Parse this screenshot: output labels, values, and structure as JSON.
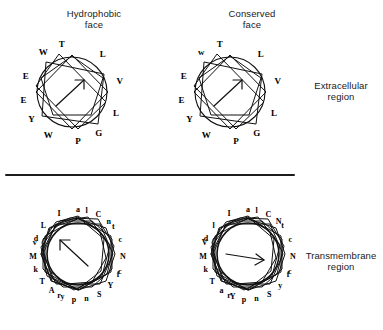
{
  "figure": {
    "divider": {
      "label": "section-divider"
    },
    "regions": {
      "extracellular": "Extracellular\nregion",
      "transmembrane": "Transmembrane\nregion"
    }
  },
  "panels": [
    {
      "id": "hydrophobic-face",
      "title": "Hydrophobic\nface",
      "region": "extracellular",
      "wheel_type": "heptagonal-star",
      "arrow_direction": "up-right",
      "residues": [
        {
          "label": "L",
          "angle_deg": 309
        },
        {
          "label": "V",
          "angle_deg": 347
        },
        {
          "label": "L",
          "angle_deg": 26
        },
        {
          "label": "T",
          "angle_deg": 258
        },
        {
          "label": "G",
          "angle_deg": 57
        },
        {
          "label": "W",
          "angle_deg": 234
        },
        {
          "label": "P",
          "angle_deg": 83
        },
        {
          "label": "E",
          "angle_deg": 199
        },
        {
          "label": "W",
          "angle_deg": 119
        },
        {
          "label": "E",
          "angle_deg": 171
        },
        {
          "label": "Y",
          "angle_deg": 146
        }
      ]
    },
    {
      "id": "conserved-face",
      "title": "Conserved\nface",
      "region": "extracellular",
      "wheel_type": "heptagonal-star",
      "arrow_direction": "up-right",
      "residues": [
        {
          "label": "L",
          "angle_deg": 309
        },
        {
          "label": "V",
          "angle_deg": 347
        },
        {
          "label": "L",
          "angle_deg": 26
        },
        {
          "label": "T",
          "angle_deg": 258
        },
        {
          "label": "G",
          "angle_deg": 57
        },
        {
          "label": "w",
          "angle_deg": 234
        },
        {
          "label": "P",
          "angle_deg": 83
        },
        {
          "label": "E",
          "angle_deg": 199
        },
        {
          "label": "W",
          "angle_deg": 119
        },
        {
          "label": "E",
          "angle_deg": 171
        },
        {
          "label": "Y",
          "angle_deg": 146
        }
      ]
    },
    {
      "id": "transmembrane-left",
      "title": "",
      "region": "transmembrane",
      "wheel_type": "dense-star",
      "arrow_direction": "up-left",
      "residues": [
        {
          "label": "a",
          "angle_deg": 270
        },
        {
          "label": "l",
          "angle_deg": 281
        },
        {
          "label": "C",
          "angle_deg": 297
        },
        {
          "label": "n",
          "angle_deg": 313
        },
        {
          "label": "t",
          "angle_deg": 322
        },
        {
          "label": "c",
          "angle_deg": 340
        },
        {
          "label": "N",
          "angle_deg": 3
        },
        {
          "label": "c",
          "angle_deg": 22
        },
        {
          "label": "f",
          "angle_deg": 27
        },
        {
          "label": "Y",
          "angle_deg": 44
        },
        {
          "label": "S",
          "angle_deg": 62
        },
        {
          "label": "n",
          "angle_deg": 79
        },
        {
          "label": "p",
          "angle_deg": 95
        },
        {
          "label": "y",
          "angle_deg": 110
        },
        {
          "label": "r",
          "angle_deg": 115
        },
        {
          "label": "A",
          "angle_deg": 126
        },
        {
          "label": "T",
          "angle_deg": 143
        },
        {
          "label": "k",
          "angle_deg": 160
        },
        {
          "label": "M",
          "angle_deg": 178
        },
        {
          "label": "v",
          "angle_deg": 196
        },
        {
          "label": "d",
          "angle_deg": 201
        },
        {
          "label": "L",
          "angle_deg": 220
        },
        {
          "label": "I",
          "angle_deg": 245
        }
      ]
    },
    {
      "id": "transmembrane-right",
      "title": "",
      "region": "transmembrane",
      "wheel_type": "dense-star",
      "arrow_direction": "right",
      "residues": [
        {
          "label": "a",
          "angle_deg": 270
        },
        {
          "label": "l",
          "angle_deg": 281
        },
        {
          "label": "C",
          "angle_deg": 297
        },
        {
          "label": "N",
          "angle_deg": 313
        },
        {
          "label": "t",
          "angle_deg": 320
        },
        {
          "label": "c",
          "angle_deg": 340
        },
        {
          "label": "N",
          "angle_deg": 3
        },
        {
          "label": "c",
          "angle_deg": 22
        },
        {
          "label": "f",
          "angle_deg": 27
        },
        {
          "label": "y",
          "angle_deg": 44
        },
        {
          "label": "S",
          "angle_deg": 62
        },
        {
          "label": "n",
          "angle_deg": 79
        },
        {
          "label": "p",
          "angle_deg": 95
        },
        {
          "label": "Y",
          "angle_deg": 110
        },
        {
          "label": "r",
          "angle_deg": 115
        },
        {
          "label": "a",
          "angle_deg": 126
        },
        {
          "label": "T",
          "angle_deg": 143
        },
        {
          "label": "k",
          "angle_deg": 160
        },
        {
          "label": "M",
          "angle_deg": 178
        },
        {
          "label": "V",
          "angle_deg": 196
        },
        {
          "label": "d",
          "angle_deg": 201
        },
        {
          "label": "l",
          "angle_deg": 220
        },
        {
          "label": "I",
          "angle_deg": 245
        }
      ]
    }
  ],
  "geometry": {
    "top_wheel": {
      "radius": 36,
      "letter_radius": 49,
      "points": 7
    },
    "bottom_wheel": {
      "radius": 31,
      "hub_radius": 25,
      "letter_radius": 45,
      "points": 18
    }
  }
}
